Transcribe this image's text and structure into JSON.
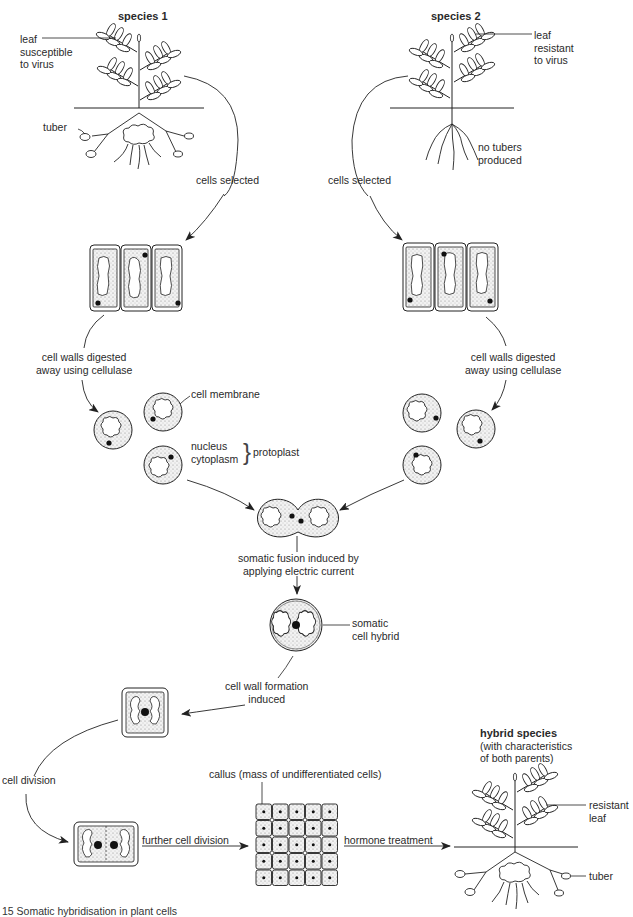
{
  "diagram": {
    "type": "process-flow",
    "topic": "somatic hybridisation of plant cells",
    "species1": {
      "title": "species 1",
      "leaf_label": [
        "leaf",
        "susceptible",
        "to virus"
      ],
      "tuber_label": "tuber",
      "cells_selected": "cells selected",
      "digest_label": [
        "cell walls digested",
        "away using cellulase"
      ]
    },
    "species2": {
      "title": "species 2",
      "leaf_label": [
        "leaf",
        "resistant",
        "to virus"
      ],
      "roots_label": [
        "no tubers",
        "produced"
      ],
      "cells_selected": "cells selected",
      "digest_label": [
        "cell walls digested",
        "away using cellulase"
      ]
    },
    "protoplast": {
      "membrane_label": "cell membrane",
      "nucleus_label": "nucleus",
      "cytoplasm_label": "cytoplasm",
      "protoplast_label": "protoplast",
      "brace": "}"
    },
    "fusion": {
      "label": [
        "somatic fusion induced by",
        "applying electric current"
      ]
    },
    "hybrid_cell": {
      "label": [
        "somatic",
        "cell hybrid"
      ]
    },
    "wall_formation": {
      "label": [
        "cell wall formation",
        "induced"
      ]
    },
    "division": {
      "cell_division": "cell division",
      "further_division": "further cell division",
      "callus_label": "callus (mass of undifferentiated cells)",
      "hormone_label": "hormone treatment"
    },
    "hybrid_species": {
      "title": "hybrid species",
      "subtitle": [
        "(with characteristics",
        "of both parents)"
      ],
      "leaf_label": [
        "resistant",
        "leaf"
      ],
      "tuber_label": "tuber"
    },
    "caption": "15 Somatic hybridisation in plant cells"
  },
  "colors": {
    "line": "#222222",
    "stipple": "#c8c8c8",
    "background": "#ffffff"
  }
}
